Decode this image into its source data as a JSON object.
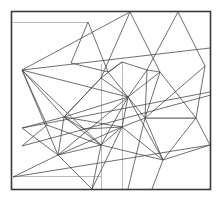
{
  "figure": {
    "type": "line-art-diagram",
    "style": "vintage engraving / technical line drawing",
    "canvas": {
      "width": 223,
      "height": 204
    },
    "background_color": "#ffffff",
    "stroke_color": "#4a4a4a",
    "frame_color": "#3a3a3a",
    "faint_stroke_color": "#a8a8a8",
    "stroke_width": 0.8,
    "frame_stroke_width": 1.6,
    "frame": {
      "x": 11.5,
      "y": 11.5,
      "width": 199,
      "height": 178
    },
    "faint_lines": [
      {
        "name": "top-left-horizontal-rule",
        "x1": 13,
        "y1": 22.5,
        "x2": 88,
        "y2": 22.5
      },
      {
        "name": "lower-left-horizontal-rule",
        "x1": 13,
        "y1": 176.5,
        "x2": 101,
        "y2": 176.5
      },
      {
        "name": "mid-right-horizontal-rule",
        "x1": 145,
        "y1": 118.5,
        "x2": 196,
        "y2": 118.5
      },
      {
        "name": "vertical-rule-left-center",
        "x1": 101.5,
        "y1": 64,
        "x2": 101.5,
        "y2": 189
      },
      {
        "name": "vertical-rule-center",
        "x1": 122.5,
        "y1": 62,
        "x2": 122.5,
        "y2": 189
      }
    ],
    "mesh_lines": [
      {
        "name": "seg-01",
        "x1": 88,
        "y1": 22,
        "x2": 108,
        "y2": 72
      },
      {
        "name": "seg-02",
        "x1": 88,
        "y1": 22,
        "x2": 71,
        "y2": 63
      },
      {
        "name": "seg-03",
        "x1": 22,
        "y1": 70,
        "x2": 130,
        "y2": 12
      },
      {
        "name": "seg-04",
        "x1": 130,
        "y1": 12,
        "x2": 101,
        "y2": 78
      },
      {
        "name": "seg-05",
        "x1": 130,
        "y1": 12,
        "x2": 160,
        "y2": 72
      },
      {
        "name": "seg-06",
        "x1": 178,
        "y1": 12,
        "x2": 147,
        "y2": 70
      },
      {
        "name": "seg-07",
        "x1": 178,
        "y1": 12,
        "x2": 205,
        "y2": 66
      },
      {
        "name": "seg-08",
        "x1": 22,
        "y1": 70,
        "x2": 210,
        "y2": 48
      },
      {
        "name": "seg-09",
        "x1": 22,
        "y1": 70,
        "x2": 128,
        "y2": 97
      },
      {
        "name": "seg-10",
        "x1": 22,
        "y1": 70,
        "x2": 64,
        "y2": 117
      },
      {
        "name": "seg-11",
        "x1": 22,
        "y1": 70,
        "x2": 47,
        "y2": 125
      },
      {
        "name": "seg-12",
        "x1": 22,
        "y1": 70,
        "x2": 58,
        "y2": 155
      },
      {
        "name": "seg-13",
        "x1": 22,
        "y1": 70,
        "x2": 84,
        "y2": 129
      },
      {
        "name": "seg-14",
        "x1": 22,
        "y1": 128,
        "x2": 210,
        "y2": 92
      },
      {
        "name": "seg-15",
        "x1": 22,
        "y1": 146,
        "x2": 211,
        "y2": 95
      },
      {
        "name": "seg-16",
        "x1": 13,
        "y1": 177,
        "x2": 210,
        "y2": 145
      },
      {
        "name": "seg-17",
        "x1": 22,
        "y1": 128,
        "x2": 58,
        "y2": 155
      },
      {
        "name": "seg-18",
        "x1": 22,
        "y1": 128,
        "x2": 64,
        "y2": 117
      },
      {
        "name": "seg-19",
        "x1": 58,
        "y1": 155,
        "x2": 64,
        "y2": 117
      },
      {
        "name": "seg-20",
        "x1": 58,
        "y1": 155,
        "x2": 92,
        "y2": 189
      },
      {
        "name": "seg-21",
        "x1": 58,
        "y1": 155,
        "x2": 101,
        "y2": 145
      },
      {
        "name": "seg-22",
        "x1": 58,
        "y1": 155,
        "x2": 128,
        "y2": 97
      },
      {
        "name": "seg-23",
        "x1": 58,
        "y1": 155,
        "x2": 122,
        "y2": 127
      },
      {
        "name": "seg-24",
        "x1": 92,
        "y1": 189,
        "x2": 122,
        "y2": 127
      },
      {
        "name": "seg-25",
        "x1": 92,
        "y1": 189,
        "x2": 101,
        "y2": 145
      },
      {
        "name": "seg-26",
        "x1": 64,
        "y1": 117,
        "x2": 101,
        "y2": 78
      },
      {
        "name": "seg-27",
        "x1": 64,
        "y1": 117,
        "x2": 128,
        "y2": 97
      },
      {
        "name": "seg-28",
        "x1": 64,
        "y1": 117,
        "x2": 122,
        "y2": 127
      },
      {
        "name": "seg-29",
        "x1": 64,
        "y1": 117,
        "x2": 101,
        "y2": 145
      },
      {
        "name": "seg-30",
        "x1": 64,
        "y1": 117,
        "x2": 84,
        "y2": 129
      },
      {
        "name": "seg-31",
        "x1": 71,
        "y1": 63,
        "x2": 108,
        "y2": 72
      },
      {
        "name": "seg-32",
        "x1": 101,
        "y1": 78,
        "x2": 128,
        "y2": 97
      },
      {
        "name": "seg-33",
        "x1": 108,
        "y1": 72,
        "x2": 128,
        "y2": 97
      },
      {
        "name": "seg-34",
        "x1": 101,
        "y1": 78,
        "x2": 122,
        "y2": 62
      },
      {
        "name": "seg-35",
        "x1": 122,
        "y1": 62,
        "x2": 147,
        "y2": 70
      },
      {
        "name": "seg-36",
        "x1": 128,
        "y1": 97,
        "x2": 147,
        "y2": 70
      },
      {
        "name": "seg-37",
        "x1": 128,
        "y1": 97,
        "x2": 160,
        "y2": 72
      },
      {
        "name": "seg-38",
        "x1": 128,
        "y1": 97,
        "x2": 145,
        "y2": 118
      },
      {
        "name": "seg-39",
        "x1": 128,
        "y1": 97,
        "x2": 122,
        "y2": 127
      },
      {
        "name": "seg-40",
        "x1": 128,
        "y1": 97,
        "x2": 101,
        "y2": 145
      },
      {
        "name": "seg-41",
        "x1": 128,
        "y1": 97,
        "x2": 163,
        "y2": 160
      },
      {
        "name": "seg-42",
        "x1": 147,
        "y1": 70,
        "x2": 160,
        "y2": 72
      },
      {
        "name": "seg-43",
        "x1": 147,
        "y1": 70,
        "x2": 145,
        "y2": 118
      },
      {
        "name": "seg-44",
        "x1": 160,
        "y1": 72,
        "x2": 145,
        "y2": 118
      },
      {
        "name": "seg-45",
        "x1": 160,
        "y1": 72,
        "x2": 196,
        "y2": 118
      },
      {
        "name": "seg-46",
        "x1": 205,
        "y1": 66,
        "x2": 145,
        "y2": 118
      },
      {
        "name": "seg-47",
        "x1": 145,
        "y1": 118,
        "x2": 196,
        "y2": 118
      },
      {
        "name": "seg-48",
        "x1": 145,
        "y1": 118,
        "x2": 163,
        "y2": 160
      },
      {
        "name": "seg-49",
        "x1": 145,
        "y1": 118,
        "x2": 122,
        "y2": 127
      },
      {
        "name": "seg-50",
        "x1": 145,
        "y1": 118,
        "x2": 128,
        "y2": 189
      },
      {
        "name": "seg-51",
        "x1": 122,
        "y1": 127,
        "x2": 163,
        "y2": 160
      },
      {
        "name": "seg-52",
        "x1": 122,
        "y1": 127,
        "x2": 101,
        "y2": 145
      },
      {
        "name": "seg-53",
        "x1": 101,
        "y1": 145,
        "x2": 163,
        "y2": 160
      },
      {
        "name": "seg-54",
        "x1": 163,
        "y1": 160,
        "x2": 210,
        "y2": 145
      },
      {
        "name": "seg-55",
        "x1": 163,
        "y1": 160,
        "x2": 196,
        "y2": 118
      },
      {
        "name": "seg-56",
        "x1": 163,
        "y1": 160,
        "x2": 152,
        "y2": 189
      },
      {
        "name": "seg-57",
        "x1": 196,
        "y1": 118,
        "x2": 210,
        "y2": 145
      },
      {
        "name": "seg-58",
        "x1": 205,
        "y1": 66,
        "x2": 196,
        "y2": 118
      },
      {
        "name": "seg-59",
        "x1": 84,
        "y1": 129,
        "x2": 122,
        "y2": 127
      },
      {
        "name": "seg-60",
        "x1": 84,
        "y1": 129,
        "x2": 101,
        "y2": 145
      },
      {
        "name": "seg-61",
        "x1": 47,
        "y1": 125,
        "x2": 101,
        "y2": 145
      },
      {
        "name": "seg-62",
        "x1": 108,
        "y1": 72,
        "x2": 122,
        "y2": 62
      },
      {
        "name": "seg-63",
        "x1": 101,
        "y1": 78,
        "x2": 64,
        "y2": 117
      },
      {
        "name": "seg-64",
        "x1": 22,
        "y1": 146,
        "x2": 47,
        "y2": 125
      },
      {
        "name": "seg-65",
        "x1": 13,
        "y1": 177,
        "x2": 58,
        "y2": 155
      }
    ],
    "vertices": [
      {
        "name": "node-left-hub",
        "x": 22,
        "y": 70
      },
      {
        "name": "node-center-left-hub",
        "x": 64,
        "y": 117
      },
      {
        "name": "node-center-hub",
        "x": 128,
        "y": 97
      },
      {
        "name": "node-right-hub",
        "x": 145,
        "y": 118
      },
      {
        "name": "node-lower-left-hub",
        "x": 58,
        "y": 155
      },
      {
        "name": "node-lower-right-hub",
        "x": 163,
        "y": 160
      },
      {
        "name": "node-upper-mid",
        "x": 101,
        "y": 78
      },
      {
        "name": "node-upper-mid-right",
        "x": 108,
        "y": 72
      },
      {
        "name": "node-top-left-corner",
        "x": 88,
        "y": 22
      },
      {
        "name": "node-top-apex-left",
        "x": 130,
        "y": 12
      },
      {
        "name": "node-top-apex-right",
        "x": 178,
        "y": 12
      },
      {
        "name": "node-mid-right-upper",
        "x": 147,
        "y": 70
      },
      {
        "name": "node-mid-right",
        "x": 160,
        "y": 72
      },
      {
        "name": "node-right-edge-upper",
        "x": 205,
        "y": 66
      },
      {
        "name": "node-right-edge-mid",
        "x": 196,
        "y": 118
      },
      {
        "name": "node-right-edge-lower",
        "x": 210,
        "y": 145
      },
      {
        "name": "node-center-lower",
        "x": 122,
        "y": 127
      },
      {
        "name": "node-lower-mid",
        "x": 101,
        "y": 145
      },
      {
        "name": "node-left-lower",
        "x": 47,
        "y": 125
      },
      {
        "name": "node-mid-low-left",
        "x": 84,
        "y": 129
      },
      {
        "name": "node-bottom-apex",
        "x": 92,
        "y": 189
      },
      {
        "name": "node-upper-left-mid",
        "x": 71,
        "y": 63
      },
      {
        "name": "node-upper-center",
        "x": 122,
        "y": 62
      }
    ]
  }
}
